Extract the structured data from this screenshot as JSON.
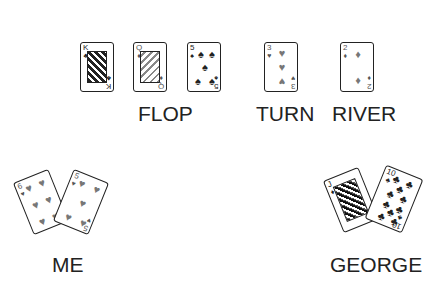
{
  "board": {
    "flop": {
      "label": "FLOP",
      "cards": [
        {
          "rank": "K",
          "suit": "♣",
          "suit_name": "clubs"
        },
        {
          "rank": "Q",
          "suit": "♦",
          "suit_name": "diamonds"
        },
        {
          "rank": "5",
          "suit": "♠",
          "suit_name": "spades"
        }
      ]
    },
    "turn": {
      "label": "TURN",
      "card": {
        "rank": "3",
        "suit": "♥",
        "suit_name": "hearts"
      }
    },
    "river": {
      "label": "RIVER",
      "card": {
        "rank": "2",
        "suit": "♦",
        "suit_name": "diamonds"
      }
    }
  },
  "players": {
    "me": {
      "label": "ME",
      "cards": [
        {
          "rank": "6",
          "suit": "♥",
          "suit_name": "hearts"
        },
        {
          "rank": "5",
          "suit": "♥",
          "suit_name": "hearts"
        }
      ]
    },
    "george": {
      "label": "GEORGE",
      "cards": [
        {
          "rank": "J",
          "suit": "♦",
          "suit_name": "diamonds"
        },
        {
          "rank": "10",
          "suit": "♣",
          "suit_name": "clubs"
        }
      ]
    }
  }
}
